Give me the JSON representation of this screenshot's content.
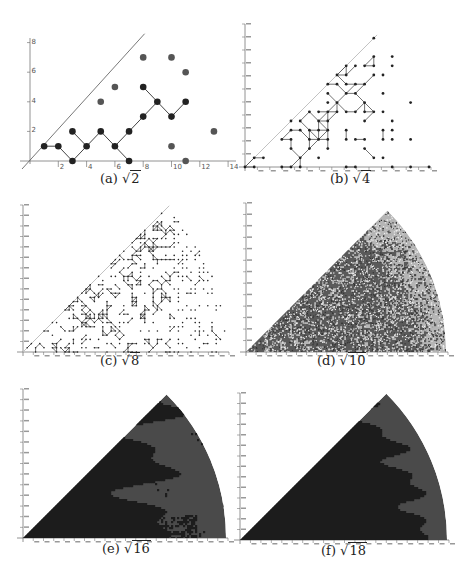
{
  "figure": {
    "panels": [
      {
        "id": "a",
        "caption_prefix": "(a)",
        "radicand": "2"
      },
      {
        "id": "b",
        "caption_prefix": "(b)",
        "radicand": "4"
      },
      {
        "id": "c",
        "caption_prefix": "(c)",
        "radicand": "8"
      },
      {
        "id": "d",
        "caption_prefix": "(d)",
        "radicand": "10"
      },
      {
        "id": "e",
        "caption_prefix": "(e)",
        "radicand": "16"
      },
      {
        "id": "f",
        "caption_prefix": "(f)",
        "radicand": "18"
      }
    ]
  },
  "colors": {
    "axis": "#777777",
    "diagonal": "#555555",
    "connected_point": "#222222",
    "isolated_point": "#555555",
    "edge": "#444444",
    "d_dark": "#5a5a5a",
    "d_light": "#b5b5b5",
    "ef_dark": "#1c1c1c",
    "ef_light": "#4a4a4a"
  },
  "chart_data": [
    {
      "panel": "a",
      "type": "scatter",
      "title": "(a) √2",
      "xlabel": "",
      "ylabel": "",
      "xticks": [
        2,
        4,
        6,
        8,
        10,
        12,
        14
      ],
      "yticks": [
        2,
        4,
        6,
        8
      ],
      "xlim": [
        0,
        14
      ],
      "ylim": [
        0,
        8
      ],
      "diagonal": "y = x",
      "connected_points": [
        [
          1,
          1
        ],
        [
          2,
          1
        ],
        [
          3,
          0
        ],
        [
          3,
          2
        ],
        [
          4,
          1
        ],
        [
          5,
          2
        ],
        [
          6,
          1
        ],
        [
          7,
          0
        ],
        [
          7,
          2
        ],
        [
          8,
          3
        ],
        [
          8,
          5
        ],
        [
          9,
          4
        ],
        [
          10,
          3
        ],
        [
          11,
          4
        ]
      ],
      "edges": [
        [
          [
            1,
            1
          ],
          [
            2,
            1
          ]
        ],
        [
          [
            2,
            1
          ],
          [
            3,
            0
          ]
        ],
        [
          [
            3,
            0
          ],
          [
            4,
            1
          ]
        ],
        [
          [
            3,
            2
          ],
          [
            4,
            1
          ]
        ],
        [
          [
            4,
            1
          ],
          [
            5,
            2
          ]
        ],
        [
          [
            5,
            2
          ],
          [
            6,
            1
          ]
        ],
        [
          [
            6,
            1
          ],
          [
            7,
            0
          ]
        ],
        [
          [
            6,
            1
          ],
          [
            7,
            2
          ]
        ],
        [
          [
            7,
            2
          ],
          [
            8,
            3
          ]
        ],
        [
          [
            8,
            3
          ],
          [
            9,
            4
          ]
        ],
        [
          [
            8,
            5
          ],
          [
            9,
            4
          ]
        ],
        [
          [
            9,
            4
          ],
          [
            10,
            3
          ]
        ],
        [
          [
            10,
            3
          ],
          [
            11,
            4
          ]
        ]
      ],
      "isolated_points": [
        [
          5,
          4
        ],
        [
          6,
          5
        ],
        [
          8,
          7
        ],
        [
          10,
          7
        ],
        [
          11,
          6
        ],
        [
          10,
          1
        ],
        [
          11,
          0
        ],
        [
          13,
          2
        ]
      ]
    },
    {
      "panel": "b",
      "type": "scatter",
      "title": "(b) √4",
      "xlabel": "",
      "ylabel": "",
      "description": "Gaussian integer points in a sector below y=x with radius ~ sqrt(N); connected clusters joined by edges, isolated points scattered",
      "xticks_count": 15,
      "yticks_count": 11
    },
    {
      "panel": "c",
      "type": "scatter",
      "title": "(c) √8",
      "description": "Denser point lattice with many connected paths, sector wedge bounded by y=x",
      "xticks_count": 20,
      "yticks_count": 14
    },
    {
      "panel": "d",
      "type": "heatmap",
      "title": "(d) √10",
      "description": "Dense speckled sector; dark grey connected region on left, lighter region near arc",
      "xticks_count": 20,
      "yticks_count": 13
    },
    {
      "panel": "e",
      "type": "heatmap",
      "title": "(e) √16",
      "description": "Solid sector; black fractal-like connected component on left, dark grey region on right",
      "xticks_count": 20,
      "yticks_count": 14
    },
    {
      "panel": "f",
      "type": "heatmap",
      "title": "(f) √18",
      "description": "Solid sector; black fractal component dominating, grey border region near the arc",
      "xticks_count": 20,
      "yticks_count": 14
    }
  ]
}
